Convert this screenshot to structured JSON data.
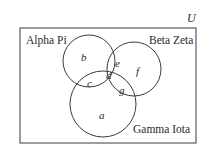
{
  "universe_label": "U",
  "sets": [
    {
      "name": "Alpha Pi"
    },
    {
      "name": "Beta Zeta"
    },
    {
      "name": "Gamma Iota"
    }
  ],
  "regions": {
    "a": "a",
    "b": "b",
    "c": "c",
    "d": "d",
    "e": "e",
    "f": "f",
    "g": "g"
  },
  "colors": {
    "stroke": "#3a3a3a",
    "text": "#2a2a2a"
  }
}
